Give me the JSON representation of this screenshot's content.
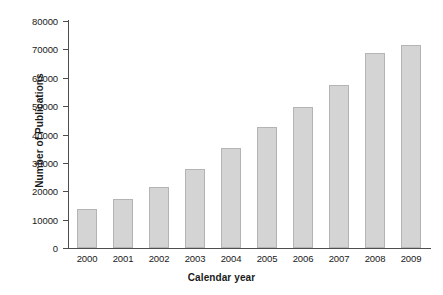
{
  "chart_data": {
    "type": "bar",
    "title": "",
    "xlabel": "Calendar year",
    "ylabel": "Number of Publications",
    "categories": [
      "2000",
      "2001",
      "2002",
      "2003",
      "2004",
      "2005",
      "2006",
      "2007",
      "2008",
      "2009"
    ],
    "values": [
      13700,
      17200,
      21500,
      27800,
      35200,
      42600,
      49600,
      57500,
      68600,
      71400
    ],
    "ylim": [
      0,
      80000
    ],
    "xlim_note": "categorical",
    "yticks": [
      0,
      10000,
      20000,
      30000,
      40000,
      50000,
      60000,
      70000,
      80000
    ],
    "ytick_labels": [
      "0",
      "10000",
      "20000",
      "30000",
      "40000",
      "50000",
      "60000",
      "70000",
      "80000"
    ],
    "grid": false,
    "legend": null,
    "legend_position": "none",
    "series": [
      {
        "name": "Number of Publications",
        "values": [
          13700,
          17200,
          21500,
          27800,
          35200,
          42600,
          49600,
          57500,
          68600,
          71400
        ]
      }
    ],
    "bar_fill_color": "#d4d4d4",
    "bar_border_color": "#b4b4b4",
    "axis_color": "#4d4d4d",
    "background_color": "#ffffff"
  }
}
